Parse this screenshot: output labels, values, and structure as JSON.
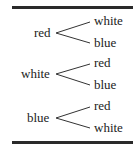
{
  "diagram": {
    "type": "tree",
    "groups": [
      {
        "root": "red",
        "children": [
          "white",
          "blue"
        ]
      },
      {
        "root": "white",
        "children": [
          "red",
          "blue"
        ]
      },
      {
        "root": "blue",
        "children": [
          "red",
          "white"
        ]
      }
    ]
  }
}
